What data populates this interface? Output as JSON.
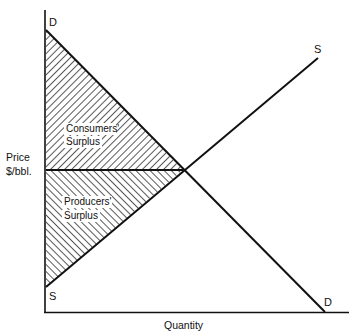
{
  "diagram": {
    "type": "supply-demand",
    "axes": {
      "y_label_line1": "Price",
      "y_label_line2": "$/bbl.",
      "x_label": "Quantity"
    },
    "curves": {
      "demand": {
        "label_start": "D",
        "label_end": "D"
      },
      "supply": {
        "label_start": "S",
        "label_end": "S"
      }
    },
    "regions": {
      "consumers": {
        "line1": "Consumers'",
        "line2": "Surplus",
        "hatch": "backslash"
      },
      "producers": {
        "line1": "Producers'",
        "line2": "Surplus",
        "hatch": "forward-slash"
      }
    },
    "colors": {
      "ink": "#111111",
      "background": "#ffffff"
    }
  }
}
